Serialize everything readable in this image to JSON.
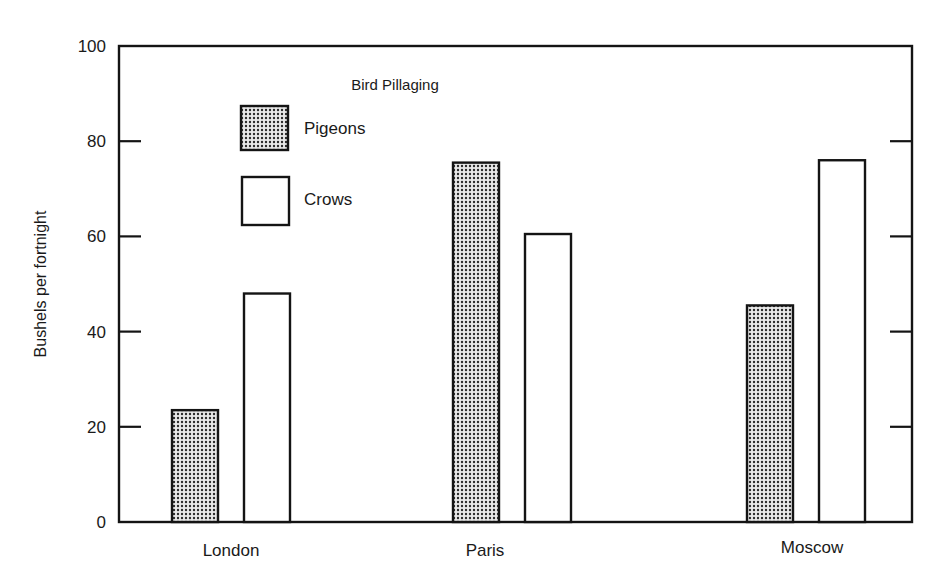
{
  "chart_data": {
    "type": "bar",
    "title": "Bird Pillaging",
    "xlabel": "",
    "ylabel": "Bushels per fortnight",
    "ylim": [
      0,
      100
    ],
    "yticks": [
      0,
      20,
      40,
      60,
      80,
      100
    ],
    "ytick_labels": [
      "0",
      "20",
      "40",
      "60",
      "80",
      "100"
    ],
    "grid": false,
    "legend_position": "top-left",
    "categories": [
      "London",
      "Paris",
      "Moscow"
    ],
    "series": [
      {
        "name": "Pigeons",
        "pattern": "dotted",
        "color": "#6e6e6e",
        "values": [
          23.5,
          75.5,
          45.5
        ]
      },
      {
        "name": "Crows",
        "pattern": "none",
        "color": "#ffffff",
        "values": [
          48,
          60.5,
          76
        ]
      }
    ]
  }
}
